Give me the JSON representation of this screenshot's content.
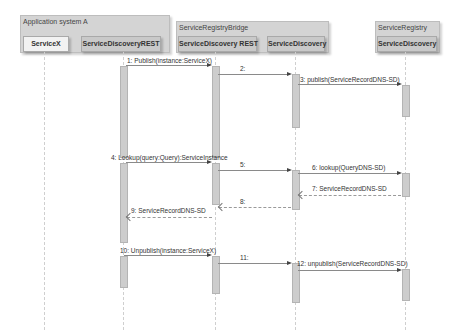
{
  "groups": [
    {
      "label": "Application system A"
    },
    {
      "label": "ServiceRegistryBridge"
    },
    {
      "label": "ServiceRegistry"
    }
  ],
  "participants": [
    {
      "name": "ServiceX"
    },
    {
      "name": "ServiceDiscoveryREST"
    },
    {
      "name": "ServiceDiscovery REST"
    },
    {
      "name": "ServiceDiscovery"
    },
    {
      "name": "ServiceDiscovery"
    }
  ],
  "messages": [
    {
      "label": "1: Publish(instance:ServiceX)"
    },
    {
      "label": "2:"
    },
    {
      "label": "3: publish(ServiceRecordDNS-SD)"
    },
    {
      "label": "4: Lookup(query:Query):ServiceInstance"
    },
    {
      "label": "5:"
    },
    {
      "label": "6: lookup(QueryDNS-SD)"
    },
    {
      "label": "7: ServiceRecordDNS-SD"
    },
    {
      "label": "8:"
    },
    {
      "label": "9: ServiceRecordDNS-SD"
    },
    {
      "label": "10: Unpublish(instance:ServiceX)"
    },
    {
      "label": "11:"
    },
    {
      "label": "12: unpublish(ServiceRecordDNS-SD)"
    }
  ]
}
